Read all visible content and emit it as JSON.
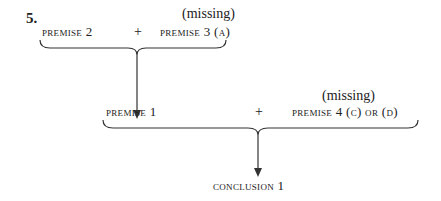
{
  "item_number": "5.",
  "top_group": {
    "left": "premise 2",
    "operator": "+",
    "missing_label": "(missing)",
    "right": "premise 3 (a)"
  },
  "bottom_group": {
    "left": "premise 1",
    "operator": "+",
    "missing_label": "(missing)",
    "right": "premise 4 (c) or (d)"
  },
  "conclusion": "conclusion 1"
}
